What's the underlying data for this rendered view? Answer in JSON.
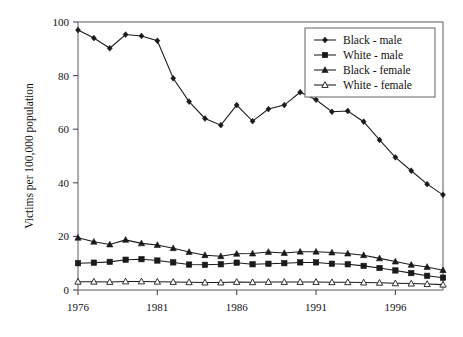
{
  "chart_data": {
    "type": "line",
    "title": "",
    "subtitle": "",
    "xlabel": "",
    "ylabel": "Victims per 100,000 population",
    "xlim": [
      1976,
      1999
    ],
    "ylim": [
      0,
      100
    ],
    "ytick_values": [
      0,
      20,
      40,
      60,
      80,
      100
    ],
    "ytick_labels": [
      "0",
      "20",
      "40",
      "60",
      "80",
      "100"
    ],
    "xtick_values": [
      1976,
      1981,
      1986,
      1991,
      1996
    ],
    "xtick_labels": [
      "1976",
      "1981",
      "1986",
      "1991",
      "1996"
    ],
    "grid": false,
    "legend_position": "top-right",
    "x": [
      1976,
      1977,
      1978,
      1979,
      1980,
      1981,
      1982,
      1983,
      1984,
      1985,
      1986,
      1987,
      1988,
      1989,
      1990,
      1991,
      1992,
      1993,
      1994,
      1995,
      1996,
      1997,
      1998,
      1999
    ],
    "series": [
      {
        "name": "Black - male",
        "marker": "filled-diamond",
        "color": "#1a1a1a",
        "values": [
          97.0,
          94.0,
          90.2,
          95.3,
          94.8,
          93.0,
          79.0,
          70.3,
          64.0,
          61.5,
          69.0,
          63.0,
          67.5,
          69.0,
          73.8,
          71.0,
          66.5,
          66.8,
          62.8,
          56.0,
          49.5,
          44.5,
          39.5,
          35.5
        ]
      },
      {
        "name": "White - male",
        "marker": "filled-square",
        "color": "#1a1a1a",
        "values": [
          10.0,
          10.2,
          10.5,
          11.3,
          11.5,
          11.0,
          10.3,
          9.5,
          9.4,
          9.6,
          10.2,
          9.6,
          9.8,
          10.0,
          10.3,
          10.3,
          9.8,
          9.6,
          9.0,
          8.2,
          7.3,
          6.3,
          5.3,
          4.6
        ]
      },
      {
        "name": "Black - female",
        "marker": "filled-triangle",
        "color": "#1a1a1a",
        "values": [
          19.5,
          18.0,
          17.0,
          18.7,
          17.4,
          16.8,
          15.6,
          14.2,
          13.0,
          12.6,
          13.5,
          13.6,
          14.2,
          13.8,
          14.3,
          14.3,
          14.0,
          13.6,
          13.0,
          11.8,
          10.6,
          9.4,
          8.6,
          7.4
        ]
      },
      {
        "name": "White - female",
        "marker": "open-triangle",
        "color": "#1a1a1a",
        "values": [
          3.1,
          3.1,
          3.0,
          3.2,
          3.2,
          3.1,
          3.0,
          2.9,
          2.8,
          2.8,
          3.0,
          2.9,
          3.0,
          3.0,
          3.0,
          3.0,
          2.9,
          2.9,
          2.8,
          2.7,
          2.5,
          2.4,
          2.2,
          2.0
        ]
      }
    ]
  }
}
